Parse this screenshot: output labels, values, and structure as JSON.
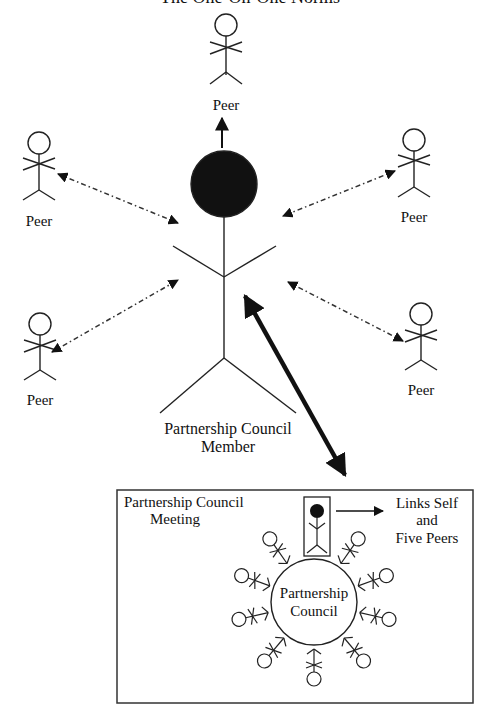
{
  "title": "The One-On-One Norms",
  "nodes": {
    "center": {
      "label_line1": "Partnership Council",
      "label_line2": "Member"
    },
    "peers": [
      {
        "id": "peer-top",
        "label": "Peer"
      },
      {
        "id": "peer-upper-left",
        "label": "Peer"
      },
      {
        "id": "peer-upper-right",
        "label": "Peer"
      },
      {
        "id": "peer-lower-left",
        "label": "Peer"
      },
      {
        "id": "peer-lower-right",
        "label": "Peer"
      }
    ]
  },
  "meeting_box": {
    "title_line1": "Partnership Council",
    "title_line2": "Meeting",
    "circle_line1": "Partnership",
    "circle_line2": "Council",
    "links_line1": "Links Self",
    "links_line2": "and",
    "links_line3": "Five Peers",
    "member_count": 12
  },
  "edges": [
    {
      "from": "center",
      "to": "peer-top",
      "style": "solid-arrow"
    },
    {
      "from": "center",
      "to": "peer-upper-left",
      "style": "dash-dot-bidirectional"
    },
    {
      "from": "center",
      "to": "peer-upper-right",
      "style": "dash-dot-bidirectional"
    },
    {
      "from": "center",
      "to": "peer-lower-left",
      "style": "dash-dot-bidirectional"
    },
    {
      "from": "center",
      "to": "peer-lower-right",
      "style": "dash-dot-bidirectional"
    },
    {
      "from": "center",
      "to": "meeting_box",
      "style": "bold-bidirectional"
    },
    {
      "from": "highlighted-member",
      "to": "links-label",
      "style": "solid-arrow"
    }
  ]
}
